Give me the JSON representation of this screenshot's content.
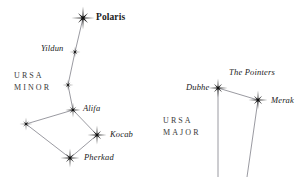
{
  "chart_data": {
    "type": "scatter",
    "title": "",
    "xlabel": "",
    "ylabel": "",
    "xlim": [
      0,
      302
    ],
    "ylim": [
      0,
      177
    ],
    "grid": false,
    "legend": null,
    "background_color": "#ffffff",
    "star_color": "#111111",
    "line_color": "#8f8f96",
    "constellations": [
      {
        "name": "URSA MINOR",
        "label_lines": [
          "URSA",
          "MINOR"
        ],
        "label_x": 14,
        "label_y": 70,
        "stars": [
          {
            "id": "polaris",
            "name": "Polaris",
            "x": 83,
            "y": 18,
            "size": 11.5,
            "labeled": true,
            "label_style": "primary",
            "label_x": 96,
            "label_y": 13
          },
          {
            "id": "yildun",
            "name": "Yildun",
            "x": 75,
            "y": 52,
            "size": 5.5,
            "labeled": true,
            "label_style": "italic",
            "label_x": 41,
            "label_y": 44
          },
          {
            "id": "urmi-g",
            "name": "",
            "x": 68,
            "y": 85,
            "size": 5.5,
            "labeled": false,
            "label_style": "",
            "label_x": 0,
            "label_y": 0
          },
          {
            "id": "alifa",
            "name": "Alifa",
            "x": 73,
            "y": 110,
            "size": 7.5,
            "labeled": true,
            "label_style": "italic",
            "label_x": 83,
            "label_y": 104
          },
          {
            "id": "urmi-w",
            "name": "",
            "x": 26,
            "y": 124,
            "size": 6.5,
            "labeled": false,
            "label_style": "",
            "label_x": 0,
            "label_y": 0
          },
          {
            "id": "kocab",
            "name": "Kocab",
            "x": 97,
            "y": 135,
            "size": 9.5,
            "labeled": true,
            "label_style": "italic",
            "label_x": 110,
            "label_y": 130
          },
          {
            "id": "pherkad",
            "name": "Pherkad",
            "x": 70,
            "y": 158,
            "size": 9.5,
            "labeled": true,
            "label_style": "italic",
            "label_x": 84,
            "label_y": 153
          }
        ],
        "links": [
          [
            "polaris",
            "yildun"
          ],
          [
            "yildun",
            "urmi-g"
          ],
          [
            "urmi-g",
            "alifa"
          ],
          [
            "alifa",
            "urmi-w"
          ],
          [
            "alifa",
            "kocab"
          ],
          [
            "urmi-w",
            "pherkad"
          ],
          [
            "kocab",
            "pherkad"
          ]
        ]
      },
      {
        "name": "URSA MAJOR",
        "label_lines": [
          "URSA",
          "MAJOR"
        ],
        "label_x": 163,
        "label_y": 115,
        "stars": [
          {
            "id": "dubhe",
            "name": "Dubhe",
            "x": 218,
            "y": 88,
            "size": 9.5,
            "labeled": true,
            "label_style": "italic",
            "label_x": 186,
            "label_y": 83
          },
          {
            "id": "merak",
            "name": "Merak",
            "x": 258,
            "y": 100,
            "size": 9.5,
            "labeled": true,
            "label_style": "italic",
            "label_x": 271,
            "label_y": 96
          }
        ],
        "links": [
          [
            "dubhe",
            "merak"
          ]
        ],
        "open_lines": [
          {
            "from": "dubhe",
            "to_x": 218,
            "to_y": 177
          },
          {
            "from": "merak",
            "to_x": 247,
            "to_y": 177
          }
        ]
      }
    ],
    "asterisms": [
      {
        "name": "The Pointers",
        "label_x": 229,
        "label_y": 68
      }
    ]
  },
  "labels": {
    "polaris": "Polaris",
    "yildun": "Yildun",
    "alifa": "Alifa",
    "kocab": "Kocab",
    "pherkad": "Pherkad",
    "dubhe": "Dubhe",
    "merak": "Merak",
    "the_pointers": "The Pointers",
    "ursa_minor_line1": "URSA",
    "ursa_minor_line2": "MINOR",
    "ursa_major_line1": "URSA",
    "ursa_major_line2": "MAJOR"
  }
}
